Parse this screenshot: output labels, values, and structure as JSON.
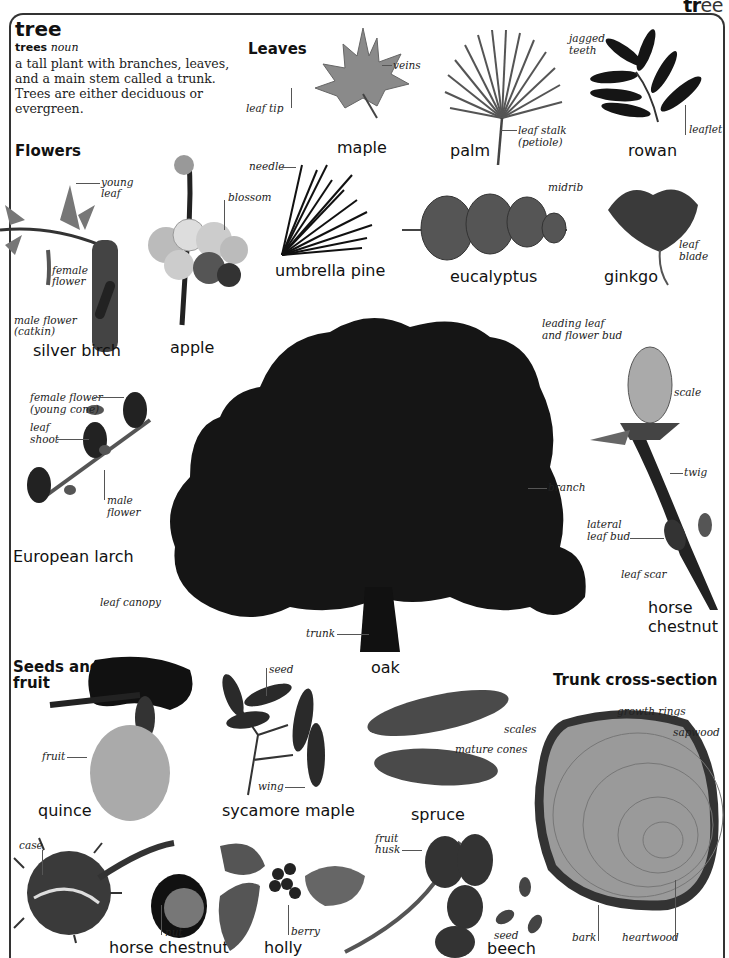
{
  "corner_heading": {
    "bold": "tr",
    "light": "ee"
  },
  "entry": {
    "headword": "tree",
    "plural_form": "trees",
    "part_of_speech": "noun",
    "definition": "a tall plant with branches, leaves, and a main stem called a trunk. Trees are either deciduous or evergreen."
  },
  "sections": {
    "leaves": "Leaves",
    "flowers": "Flowers",
    "seeds_fruit": "Seeds and fruit",
    "trunk_cross_section": "Trunk cross-section"
  },
  "leaves": [
    {
      "name": "maple",
      "labels": [
        "veins",
        "leaf tip"
      ]
    },
    {
      "name": "palm",
      "labels": [
        "leaf stalk (petiole)"
      ]
    },
    {
      "name": "rowan",
      "labels": [
        "jagged teeth",
        "leaflet"
      ]
    },
    {
      "name": "umbrella pine",
      "labels": [
        "needle"
      ]
    },
    {
      "name": "eucalyptus",
      "labels": [
        "midrib"
      ]
    },
    {
      "name": "ginkgo",
      "labels": [
        "leaf blade"
      ]
    }
  ],
  "flowers": [
    {
      "name": "silver birch",
      "labels": [
        "young leaf",
        "female flower",
        "male flower (catkin)"
      ]
    },
    {
      "name": "apple",
      "labels": [
        "blossom"
      ]
    },
    {
      "name": "European larch",
      "labels": [
        "female flower (young cone)",
        "leaf shoot",
        "male flower"
      ]
    }
  ],
  "main_tree": {
    "name": "oak",
    "labels": [
      "branch",
      "leaf canopy",
      "trunk"
    ]
  },
  "bud": {
    "name": "horse chestnut",
    "labels": [
      "leading leaf and flower bud",
      "scale",
      "twig",
      "lateral leaf bud",
      "leaf scar"
    ]
  },
  "seeds_fruit": [
    {
      "name": "quince",
      "labels": [
        "fruit"
      ]
    },
    {
      "name": "sycamore maple",
      "labels": [
        "seed",
        "wing"
      ]
    },
    {
      "name": "spruce",
      "labels": [
        "scales",
        "mature cones"
      ]
    },
    {
      "name": "horse chestnut",
      "labels": [
        "case",
        "nut"
      ]
    },
    {
      "name": "holly",
      "labels": [
        "berry"
      ]
    },
    {
      "name": "beech",
      "labels": [
        "fruit husk",
        "seed"
      ]
    }
  ],
  "cross_section": {
    "labels": [
      "growth rings",
      "sapwood",
      "bark",
      "heartwood"
    ]
  },
  "text_lines": {
    "young_leaf_1": "young",
    "young_leaf_2": "leaf",
    "female_flower_1": "female",
    "female_flower_2": "flower",
    "male_catkin_1": "male flower",
    "male_catkin_2": "(catkin)",
    "leaf_stalk_1": "leaf stalk",
    "leaf_stalk_2": "(petiole)",
    "jagged_1": "jagged",
    "jagged_2": "teeth",
    "leaf_blade_1": "leaf",
    "leaf_blade_2": "blade",
    "larch_female_1": "female flower",
    "larch_female_2": "(young cone)",
    "leaf_shoot_1": "leaf",
    "leaf_shoot_2": "shoot",
    "larch_male_1": "male",
    "larch_male_2": "flower",
    "bud_lead_1": "leading leaf",
    "bud_lead_2": "and flower bud",
    "lateral_1": "lateral",
    "lateral_2": "leaf bud",
    "hc_name_1": "horse",
    "hc_name_2": "chestnut",
    "seeds_1": "Seeds and",
    "seeds_2": "fruit",
    "husk_1": "fruit",
    "husk_2": "husk"
  },
  "colors": {
    "frame": "#333333",
    "foliage": "#151515",
    "leaf_grey": "#8a8a8a",
    "wood": "#9a9a9a",
    "text": "#111111"
  }
}
